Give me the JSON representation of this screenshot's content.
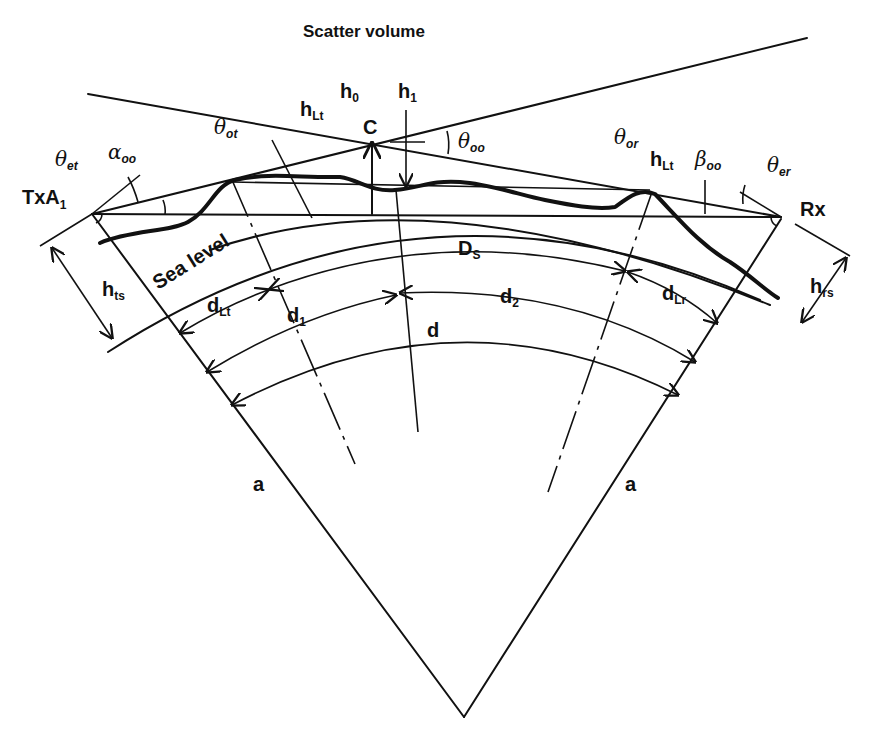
{
  "title": "Scatter volume",
  "labels": {
    "tx": {
      "main": "TxA",
      "sub": "1"
    },
    "rx": "Rx",
    "scatter_point": "C",
    "sea_level": "Sea level",
    "h0": {
      "main": "h",
      "sub": "0"
    },
    "h1": {
      "main": "h",
      "sub": "1"
    },
    "hLt_left": {
      "main": "h",
      "sub": "Lt"
    },
    "hLt_right": {
      "main": "h",
      "sub": "Lt"
    },
    "hts": {
      "main": "h",
      "sub": "ts"
    },
    "hrs": {
      "main": "h",
      "sub": "rs"
    },
    "theta_et": {
      "main": "θ",
      "sub": "et"
    },
    "theta_ot": {
      "main": "θ",
      "sub": "ot"
    },
    "theta_oo": {
      "main": "θ",
      "sub": "oo"
    },
    "theta_or": {
      "main": "θ",
      "sub": "or"
    },
    "theta_er": {
      "main": "θ",
      "sub": "er"
    },
    "alpha_oo": {
      "main": "α",
      "sub": "oo"
    },
    "beta_oo": {
      "main": "β",
      "sub": "oo"
    },
    "Ds": {
      "main": "D",
      "sub": "S"
    },
    "dLt": {
      "main": "d",
      "sub": "Lt"
    },
    "dLr": {
      "main": "d",
      "sub": "Lr"
    },
    "d1": {
      "main": "d",
      "sub": "1"
    },
    "d2": {
      "main": "d",
      "sub": "2"
    },
    "d": "d",
    "radius_left": "a",
    "radius_right": "a"
  }
}
